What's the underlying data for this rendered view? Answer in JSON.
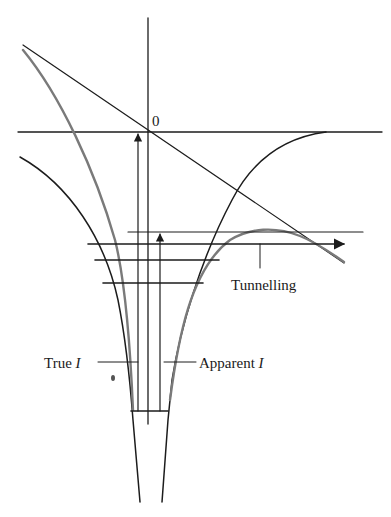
{
  "figure": {
    "type": "energy-level diagram (potential well with barrier and tunnelling)",
    "colors": {
      "ink": "#1c1c1c",
      "modified_potential": "#7a7a7a",
      "background": "#ffffff"
    },
    "labels": {
      "origin": "0",
      "tunnelling": "Tunnelling",
      "true_prefix": "True ",
      "true_symbol": "I",
      "apparent_prefix": "Apparent ",
      "apparent_symbol": "I"
    },
    "elements": {
      "axes": [
        "horizontal energy zero line",
        "vertical axis"
      ],
      "curves": [
        "left coulomb well wall",
        "right coulomb well wall",
        "field-modified potential (grey)",
        "applied field diagonal line"
      ],
      "energy_levels": 5,
      "arrows": [
        "true ionization arrow to 0",
        "apparent ionization arrow to barrier top",
        "tunnelling arrow"
      ]
    }
  }
}
